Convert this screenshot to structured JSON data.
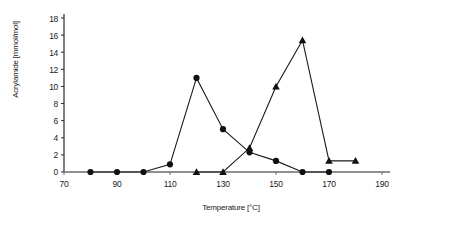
{
  "chart_data": {
    "type": "line",
    "title": "",
    "xlabel": "Temperature [°C]",
    "ylabel": "Acrylamide [mmol/mol]",
    "xlim": [
      70,
      190
    ],
    "ylim": [
      0,
      18
    ],
    "xticks": [
      70,
      90,
      110,
      130,
      150,
      170,
      190
    ],
    "yticks": [
      0,
      2,
      4,
      6,
      8,
      10,
      12,
      14,
      16,
      18
    ],
    "grid": false,
    "legend": "none",
    "series": [
      {
        "name": "circle-series",
        "marker": "circle",
        "x": [
          80,
          90,
          100,
          110,
          120,
          130,
          140,
          150,
          160,
          170
        ],
        "values": [
          0,
          0,
          0,
          0.9,
          11.0,
          5.0,
          2.3,
          1.3,
          0,
          0
        ]
      },
      {
        "name": "triangle-series",
        "marker": "triangle",
        "x": [
          120,
          130,
          140,
          150,
          160,
          170,
          180
        ],
        "values": [
          0,
          0,
          2.8,
          10.0,
          15.4,
          1.3,
          1.3
        ]
      }
    ]
  },
  "axis": {
    "ylabel_text": "Acrylamide [mmol/mol]",
    "xlabel_text": "Temperature [°C]",
    "ytick_labels": [
      "18",
      "16",
      "14",
      "12",
      "10",
      "8",
      "6",
      "4",
      "2",
      "0"
    ],
    "xtick_labels": [
      "70",
      "90",
      "110",
      "130",
      "150",
      "170",
      "190"
    ]
  }
}
